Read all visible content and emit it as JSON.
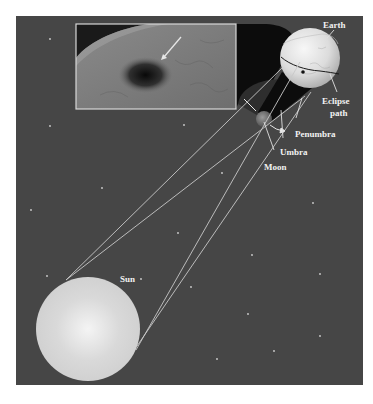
{
  "diagram": {
    "type": "solar-eclipse-geometry",
    "colors": {
      "page_bg": "#ffffff",
      "space_bg": "#464646",
      "panel_border": "#d8d8d8",
      "star": "#d0d0d0",
      "ray": "#c8c8c8",
      "label": "#f2f2f2",
      "leader": "#e0e0e0",
      "shadow": "#0c0c0c",
      "penumbra_halo": "#2e2e2e"
    },
    "panel": {
      "x": 16,
      "y": 16,
      "w": 347,
      "h": 369
    },
    "labels": {
      "earth": "Earth",
      "eclipse_path_line1": "Eclipse",
      "eclipse_path_line2": "path",
      "penumbra": "Penumbra",
      "umbra": "Umbra",
      "moon": "Moon",
      "sun": "Sun"
    },
    "bodies": {
      "sun": {
        "cx": 88,
        "cy": 329,
        "r": 52
      },
      "moon": {
        "cx": 264,
        "cy": 119,
        "r": 8
      },
      "earth": {
        "cx": 310,
        "cy": 58,
        "r": 30
      }
    },
    "inset_photo": {
      "x": 76,
      "y": 24,
      "w": 160,
      "h": 85,
      "caption": "Photo of the Moon's shadow on Earth's surface, viewed from orbit"
    },
    "stars": [
      [
        50,
        39
      ],
      [
        50,
        126
      ],
      [
        31,
        210
      ],
      [
        102,
        188
      ],
      [
        184,
        125
      ],
      [
        178,
        233
      ],
      [
        47,
        276
      ],
      [
        141,
        279
      ],
      [
        191,
        287
      ],
      [
        252,
        255
      ],
      [
        313,
        203
      ],
      [
        320,
        274
      ],
      [
        248,
        314
      ],
      [
        320,
        336
      ],
      [
        274,
        351
      ],
      [
        217,
        359
      ],
      [
        222,
        173
      ]
    ]
  }
}
